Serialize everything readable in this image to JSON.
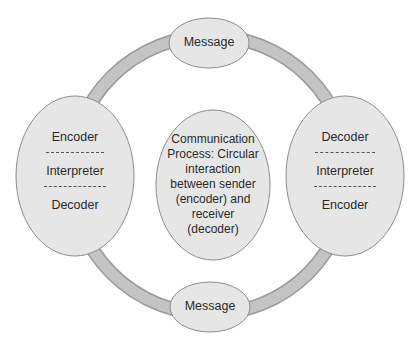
{
  "diagram": {
    "title": "Communication Process: Circular interaction between sender (encoder) and receiver (decoder)",
    "colors": {
      "ring": "#c4c4c4",
      "ring_edge": "#9a9a9a",
      "node_fill": "#e6e6e6",
      "node_stroke": "#8c8c8c",
      "text": "#2a2a2a"
    },
    "top_node": {
      "label": "Message"
    },
    "bottom_node": {
      "label": "Message"
    },
    "left_node": {
      "lines": [
        "Encoder",
        "Interpreter",
        "Decoder"
      ]
    },
    "right_node": {
      "lines": [
        "Decoder",
        "Interpreter",
        "Encoder"
      ]
    },
    "center_node": {
      "lines": [
        "Communication",
        "Process: Circular",
        "interaction",
        "between sender",
        "(encoder) and",
        "receiver",
        "(decoder)"
      ]
    }
  }
}
